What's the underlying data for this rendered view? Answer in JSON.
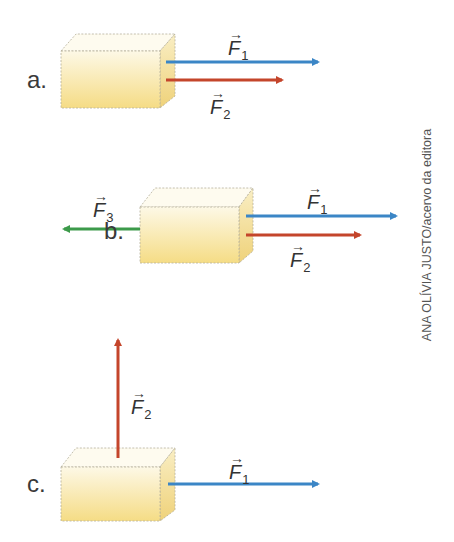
{
  "credit": "ANA OLÍVIA JUSTO/acervo da editora",
  "colors": {
    "f_blue": "#3b86c6",
    "f_red": "#c4452b",
    "f_green": "#3c9a4a",
    "box_top": "#fdf7e2",
    "box_bottom": "#f6df8c"
  },
  "vector_arrow": "→",
  "panels": [
    {
      "label": "a.",
      "forces": [
        {
          "name": "F",
          "sub": "1",
          "direction": "right",
          "color": "blue"
        },
        {
          "name": "F",
          "sub": "2",
          "direction": "right",
          "color": "red"
        }
      ]
    },
    {
      "label": "b.",
      "forces": [
        {
          "name": "F",
          "sub": "3",
          "direction": "left",
          "color": "green"
        },
        {
          "name": "F",
          "sub": "1",
          "direction": "right",
          "color": "blue"
        },
        {
          "name": "F",
          "sub": "2",
          "direction": "right",
          "color": "red"
        }
      ]
    },
    {
      "label": "c.",
      "forces": [
        {
          "name": "F",
          "sub": "2",
          "direction": "up",
          "color": "red"
        },
        {
          "name": "F",
          "sub": "1",
          "direction": "right",
          "color": "blue"
        }
      ]
    }
  ]
}
